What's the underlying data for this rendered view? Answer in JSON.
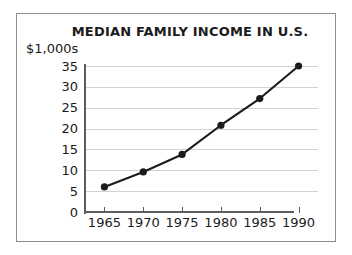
{
  "chart_data": {
    "type": "line",
    "title": "MEDIAN FAMILY INCOME IN U.S.",
    "ylabel": "$1,000s",
    "xlabel": "",
    "x": [
      1965,
      1970,
      1975,
      1980,
      1985,
      1990
    ],
    "categories": [
      "1965",
      "1970",
      "1975",
      "1980",
      "1985",
      "1990"
    ],
    "values": [
      6,
      9.6,
      13.8,
      20.8,
      27.2,
      35
    ],
    "series": [
      {
        "name": "Median family income",
        "values": [
          6,
          9.6,
          13.8,
          20.8,
          27.2,
          35
        ]
      }
    ],
    "xlim": [
      1962.5,
      1992.5
    ],
    "ylim": [
      0,
      35
    ],
    "yticks": [
      0,
      5,
      10,
      15,
      20,
      25,
      30,
      35
    ],
    "ytick_labels": [
      "0",
      "5",
      "10",
      "15",
      "20",
      "25",
      "30",
      "35"
    ],
    "xticks": [
      1965,
      1970,
      1975,
      1980,
      1985,
      1990
    ],
    "xtick_labels": [
      "1965",
      "1970",
      "1975",
      "1980",
      "1985",
      "1990"
    ],
    "grid": "horizontal",
    "legend": "none",
    "marker": "filled-circle",
    "line_color": "#1b1b1b",
    "marker_color": "#1b1b1b",
    "grid_color": "#d2d2d2",
    "axis_color": "#5e5e5e",
    "frame_color": "#8c8c8c",
    "background_color": "#ffffff"
  }
}
